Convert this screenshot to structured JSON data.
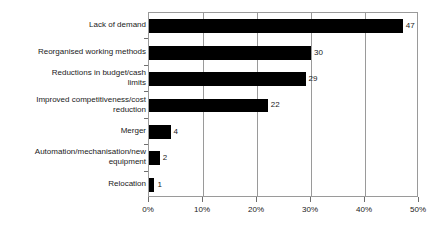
{
  "chart_data": {
    "type": "bar",
    "orientation": "horizontal",
    "title": "",
    "subtitle": "",
    "xlabel": "",
    "ylabel": "",
    "xlim": [
      0,
      50
    ],
    "xtick_values": [
      0,
      10,
      20,
      30,
      40,
      50
    ],
    "xtick_labels": [
      "0%",
      "10%",
      "20%",
      "30%",
      "40%",
      "50%"
    ],
    "grid": "vertical",
    "legend": "none",
    "bar_color": "#000000",
    "plot_border_color": "#9a9a9a",
    "background_color": "#ffffff",
    "categories": [
      "Lack of demand",
      "Reorganised working methods",
      "Reductions in budget/cash\nlimits",
      "Improved competitiveness/cost\nreduction",
      "Merger",
      "Automation/mechanisation/new\nequipment",
      "Relocation"
    ],
    "values": [
      47,
      30,
      29,
      22,
      4,
      2,
      1
    ],
    "value_labels": [
      "47",
      "30",
      "29",
      "22",
      "4",
      "2",
      "1"
    ]
  }
}
